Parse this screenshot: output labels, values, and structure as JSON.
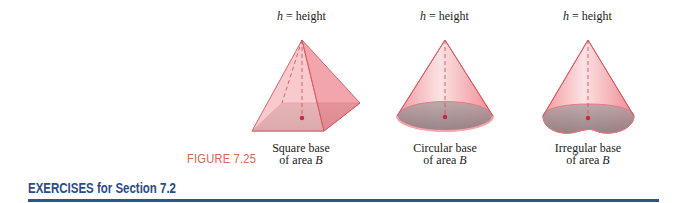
{
  "figures": [
    {
      "id": "pyramid",
      "height_label": {
        "var": "h",
        "eq": " = height"
      },
      "caption_line1": "Square base",
      "caption_line2_prefix": "of area ",
      "caption_line2_var": "B"
    },
    {
      "id": "circular-cone",
      "height_label": {
        "var": "h",
        "eq": " = height"
      },
      "caption_line1": "Circular base",
      "caption_line2_prefix": "of area ",
      "caption_line2_var": "B"
    },
    {
      "id": "irregular-cone",
      "height_label": {
        "var": "h",
        "eq": " = height"
      },
      "caption_line1": "Irregular base",
      "caption_line2_prefix": "of area ",
      "caption_line2_var": "B"
    }
  ],
  "figure_label": "FIGURE 7.25",
  "section_heading": "EXERCISES for Section 7.2",
  "colors": {
    "solid_fill": "#f2a3a8",
    "solid_edge": "#d9535e",
    "base_fill": "#9c8a8c",
    "figure_label": "#d7654f",
    "heading": "#2d4a85",
    "rule": "#2e5494"
  }
}
